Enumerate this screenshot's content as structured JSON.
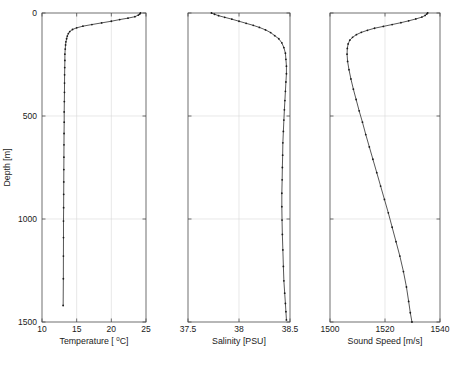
{
  "figure": {
    "background_color": "#ffffff",
    "line_color": "#2b2b2b",
    "marker_color": "#1a1a1a",
    "grid_color": "#d9d9d9",
    "axis_color": "#4d4d4d",
    "shared_y_axis_label": "Depth [m]",
    "y_ticks": [
      0,
      500,
      1000,
      1500
    ],
    "y_tick_labels": [
      "0",
      "500",
      "1000",
      "1500"
    ],
    "y_limits": [
      0,
      1500
    ],
    "y_inverted": true
  },
  "caption": {
    "text": ""
  },
  "chart_data": [
    {
      "type": "line",
      "id": "temperature-profile",
      "title": "",
      "xlabel": "Temperature [ °C]",
      "xlabel_main": "Temperature [ ",
      "xlabel_sup": "0",
      "xlabel_tail": "C]",
      "ylabel": "Depth [m]",
      "xlim": [
        10,
        25
      ],
      "ylim": [
        0,
        1500
      ],
      "x_ticks": [
        10,
        15,
        20,
        25
      ],
      "x_tick_labels": [
        "10",
        "15",
        "20",
        "25"
      ],
      "y_ticks": [
        0,
        500,
        1000,
        1500
      ],
      "y_tick_labels": [
        "0",
        "500",
        "1000",
        "1500"
      ],
      "grid": true,
      "y_inverted": true,
      "markers": true,
      "x": [
        24.2,
        24.1,
        23.9,
        23.4,
        22.4,
        21.2,
        20.0,
        18.6,
        17.2,
        15.9,
        15.0,
        14.4,
        14.0,
        13.8,
        13.65,
        13.55,
        13.45,
        13.4,
        13.35,
        13.3,
        13.3,
        13.28,
        13.26,
        13.25,
        13.24,
        13.22,
        13.2,
        13.2,
        13.18,
        13.17,
        13.16,
        13.15,
        13.14,
        13.13,
        13.12,
        13.1,
        13.1,
        13.09,
        13.08,
        13.05
      ],
      "y": [
        0,
        5,
        10,
        18,
        25,
        32,
        40,
        48,
        56,
        64,
        72,
        80,
        90,
        100,
        112,
        125,
        140,
        155,
        175,
        200,
        230,
        265,
        300,
        340,
        385,
        430,
        480,
        530,
        585,
        640,
        700,
        760,
        820,
        880,
        945,
        1010,
        1090,
        1180,
        1290,
        1420
      ],
      "x_axis_label_unit": "degC",
      "y_axis_label_unit": "m"
    },
    {
      "type": "line",
      "id": "salinity-profile",
      "title": "",
      "xlabel": "Salinity [PSU]",
      "ylabel": "Depth [m]",
      "xlim": [
        37.5,
        38.5
      ],
      "ylim": [
        0,
        1500
      ],
      "x_ticks": [
        37.5,
        38,
        38.5
      ],
      "x_tick_labels": [
        "37.5",
        "38",
        "38.5"
      ],
      "y_ticks": [
        0,
        500,
        1000,
        1500
      ],
      "y_tick_labels": [
        "0",
        "500",
        "1000",
        "1500"
      ],
      "grid": true,
      "y_inverted": true,
      "markers": true,
      "x": [
        37.73,
        37.76,
        37.8,
        37.86,
        37.93,
        38.0,
        38.07,
        38.14,
        38.2,
        38.26,
        38.31,
        38.35,
        38.39,
        38.42,
        38.44,
        38.455,
        38.46,
        38.465,
        38.465,
        38.46,
        38.455,
        38.45,
        38.445,
        38.44,
        38.435,
        38.43,
        38.428,
        38.425,
        38.423,
        38.42,
        38.42,
        38.422,
        38.425,
        38.43,
        38.435,
        38.44,
        38.448,
        38.455,
        38.46,
        38.465
      ],
      "y": [
        0,
        6,
        13,
        21,
        30,
        40,
        50,
        60,
        70,
        82,
        95,
        110,
        125,
        145,
        168,
        195,
        225,
        258,
        295,
        335,
        380,
        425,
        470,
        520,
        575,
        630,
        690,
        750,
        810,
        875,
        940,
        1005,
        1075,
        1150,
        1230,
        1300,
        1360,
        1410,
        1450,
        1490
      ],
      "x_axis_label_unit": "PSU",
      "y_axis_label_unit": "m"
    },
    {
      "type": "line",
      "id": "sound-speed-profile",
      "title": "",
      "xlabel": "Sound Speed [m/s]",
      "ylabel": "Depth [m]",
      "xlim": [
        1500,
        1540
      ],
      "ylim": [
        0,
        1500
      ],
      "x_ticks": [
        1500,
        1520,
        1540
      ],
      "x_tick_labels": [
        "1500",
        "1520",
        "1540"
      ],
      "y_ticks": [
        0,
        500,
        1000,
        1500
      ],
      "y_tick_labels": [
        "0",
        "500",
        "1000",
        "1500"
      ],
      "grid": true,
      "y_inverted": true,
      "markers": true,
      "x": [
        1535.5,
        1535.2,
        1534.6,
        1533.4,
        1531.2,
        1528.6,
        1525.8,
        1522.6,
        1519.4,
        1516.2,
        1513.6,
        1511.4,
        1509.6,
        1508.2,
        1507.2,
        1506.6,
        1506.3,
        1506.2,
        1506.4,
        1506.9,
        1507.6,
        1508.5,
        1509.5,
        1510.6,
        1511.8,
        1513.0,
        1514.3,
        1515.6,
        1517.0,
        1518.4,
        1519.8,
        1521.2,
        1522.6,
        1524.0,
        1525.4,
        1526.7,
        1527.8,
        1528.6,
        1529.2,
        1529.8
      ],
      "y": [
        0,
        5,
        12,
        20,
        29,
        38,
        47,
        56,
        65,
        74,
        84,
        94,
        105,
        118,
        132,
        150,
        172,
        200,
        235,
        275,
        320,
        370,
        420,
        475,
        530,
        590,
        650,
        710,
        775,
        840,
        905,
        970,
        1040,
        1110,
        1180,
        1255,
        1330,
        1400,
        1455,
        1500
      ],
      "x_axis_label_unit": "m/s",
      "y_axis_label_unit": "m"
    }
  ],
  "panel_geometry": [
    {
      "left": 42,
      "right": 146,
      "top": 13,
      "bottom": 322
    },
    {
      "left": 188,
      "right": 290,
      "top": 13,
      "bottom": 322
    },
    {
      "left": 330,
      "right": 440,
      "top": 13,
      "bottom": 322
    }
  ]
}
